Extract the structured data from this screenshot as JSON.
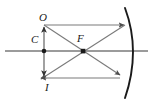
{
  "figure": {
    "name": "concave-mirror-ray-diagram",
    "background_color": "#ffffff",
    "line_color": "#4d4d4d",
    "mirror_color": "#1a1a1a",
    "label_color": "#1a1a1a",
    "width": 152,
    "height": 105
  },
  "labels": {
    "object": "O",
    "center_of_curvature": "C",
    "focus": "F",
    "image": "I"
  },
  "geometry": {
    "principal_axis": {
      "x1": 5,
      "y1": 51,
      "x2": 148,
      "y2": 51
    },
    "mirror": {
      "type": "concave-arc",
      "vertex": {
        "x": 133,
        "y": 51
      },
      "top": {
        "x": 125,
        "y": 8
      },
      "bottom": {
        "x": 125,
        "y": 98
      }
    },
    "points": [
      {
        "name": "C",
        "x": 44,
        "y": 51
      },
      {
        "name": "F",
        "x": 83,
        "y": 51
      }
    ],
    "object_arrow": {
      "x": 44,
      "base_y": 51,
      "tip_y": 25,
      "direction": "up"
    },
    "image_arrow": {
      "x": 44,
      "base_y": 51,
      "tip_y": 78,
      "direction": "down"
    },
    "rays": [
      {
        "name": "parallel-ray-incident",
        "x1": 44,
        "y1": 25,
        "x2": 125,
        "y2": 25
      },
      {
        "name": "parallel-ray-reflected",
        "x1": 125,
        "y1": 25,
        "x2": 44,
        "y2": 78
      },
      {
        "name": "focal-ray-incident",
        "x1": 44,
        "y1": 25,
        "x2": 120,
        "y2": 76
      },
      {
        "name": "focal-ray-reflected",
        "x1": 120,
        "y1": 76,
        "x2": 44,
        "y2": 78
      }
    ]
  }
}
